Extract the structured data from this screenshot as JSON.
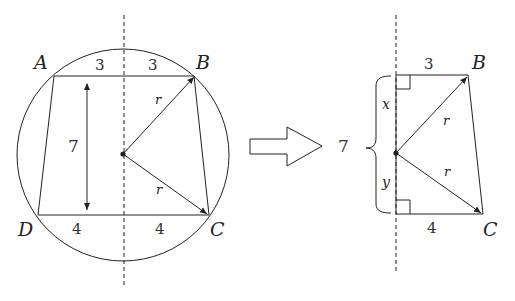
{
  "left_figure": {
    "vertices": {
      "A": "A",
      "B": "B",
      "C": "C",
      "D": "D"
    },
    "top_segments": [
      "3",
      "3"
    ],
    "bottom_segments": [
      "4",
      "4"
    ],
    "height_label": "7",
    "radius_labels": [
      "r",
      "r"
    ]
  },
  "right_figure": {
    "vertices": {
      "B": "B",
      "C": "C"
    },
    "top_segment": "3",
    "bottom_segment": "4",
    "brace_label": "7",
    "upper_part": "x",
    "lower_part": "y",
    "radius_labels": [
      "r",
      "r"
    ]
  },
  "colors": {
    "stroke": "#222222",
    "background": "#ffffff"
  }
}
